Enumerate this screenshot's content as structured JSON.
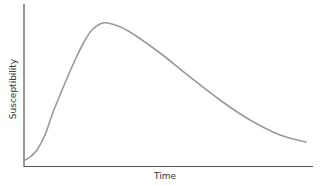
{
  "chart_data": {
    "type": "line",
    "title": "",
    "xlabel": "Time",
    "ylabel": "Susceptibility",
    "grid": false,
    "legend": null,
    "x_ticks": [],
    "y_ticks": [],
    "series": [
      {
        "name": "Susceptibility",
        "x": [
          0,
          5,
          8,
          9,
          10,
          13,
          18,
          23,
          27,
          30,
          37,
          47,
          57,
          66,
          76,
          86,
          94,
          100
        ],
        "y": [
          4,
          10,
          18,
          24,
          36,
          52,
          74,
          88,
          92,
          91,
          85,
          73,
          60,
          47,
          35,
          23,
          17,
          14
        ]
      }
    ],
    "annotations": [
      "Curve rises steeply from near zero, peaks early (~30% of time axis), then declines gradually"
    ],
    "colors": {
      "curve": "#9a9a9a",
      "axis": "#555555"
    },
    "pixel_path": [
      [
        25,
        160
      ],
      [
        30,
        157
      ],
      [
        37,
        150
      ],
      [
        45,
        135
      ],
      [
        52,
        115
      ],
      [
        60,
        95
      ],
      [
        68,
        76
      ],
      [
        76,
        58
      ],
      [
        84,
        42
      ],
      [
        92,
        30
      ],
      [
        103,
        23
      ],
      [
        115,
        25
      ],
      [
        130,
        32
      ],
      [
        160,
        53
      ],
      [
        190,
        77
      ],
      [
        220,
        100
      ],
      [
        250,
        120
      ],
      [
        280,
        135
      ],
      [
        306,
        142
      ]
    ]
  }
}
